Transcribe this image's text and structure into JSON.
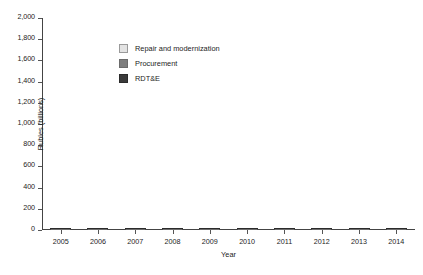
{
  "chart_data": {
    "type": "bar",
    "stacked": true,
    "title": "",
    "xlabel": "Year",
    "ylabel": "Rubles (billions)",
    "categories": [
      "2005",
      "2006",
      "2007",
      "2008",
      "2009",
      "2010",
      "2011",
      "2012",
      "2013",
      "2014"
    ],
    "ylim": [
      0,
      2000
    ],
    "yticks": [
      0,
      200,
      400,
      600,
      800,
      1000,
      1200,
      1400,
      1600,
      1800,
      2000
    ],
    "ytick_labels": [
      "0",
      "200",
      "400",
      "600",
      "800",
      "1,000",
      "1,200",
      "1,400",
      "1,600",
      "1,800",
      "2,000"
    ],
    "grid": false,
    "legend_position": "upper-left-inside",
    "series": [
      {
        "name": "RDT&E",
        "color": "#3a3a3a",
        "values": [
          65,
          68,
          92,
          95,
          125,
          110,
          115,
          125,
          165,
          240
        ]
      },
      {
        "name": "Procurement",
        "color": "#7e7e7e",
        "values": [
          70,
          122,
          138,
          205,
          280,
          295,
          335,
          465,
          805,
          1080
        ]
      },
      {
        "name": "Repair and modernization",
        "color": "#e3e3e3",
        "values": [
          45,
          40,
          60,
          85,
          65,
          75,
          130,
          135,
          195,
          490
        ]
      }
    ],
    "totals": [
      180,
      230,
      290,
      385,
      470,
      480,
      580,
      725,
      1165,
      1810
    ]
  },
  "legend": {
    "items": [
      {
        "label": "Repair and modernization",
        "swatch": "repair-swatch"
      },
      {
        "label": "Procurement",
        "swatch": "procurement-swatch"
      },
      {
        "label": "RDT&E",
        "swatch": "rdte-swatch"
      }
    ]
  },
  "colors": {
    "rdte": "#3a3a3a",
    "procurement": "#7e7e7e",
    "repair": "#e3e3e3",
    "axis": "#444444",
    "text": "#1c1c1c",
    "background": "#ffffff"
  }
}
